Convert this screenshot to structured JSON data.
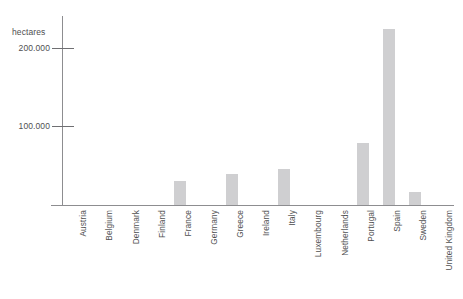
{
  "chart_data": {
    "type": "bar",
    "title": "",
    "subtitle": "",
    "xlabel": "",
    "ylabel": "hectares",
    "ylim": [
      0,
      240000
    ],
    "yticks": [
      100000,
      200000
    ],
    "ytick_labels": [
      "100.000",
      "200.000"
    ],
    "grid": false,
    "legend": null,
    "categories": [
      "Austria",
      "Belgium",
      "Denmark",
      "Finland",
      "France",
      "Germany",
      "Greece",
      "Ireland",
      "Italy",
      "Luxembourg",
      "Netherlands",
      "Portugal",
      "Spain",
      "Sweden",
      "United Kingdom"
    ],
    "values": [
      0,
      0,
      0,
      0,
      30000,
      0,
      39000,
      0,
      46000,
      0,
      0,
      79000,
      224000,
      17000,
      0
    ],
    "bar_color": "#cfcfd1",
    "axis_color": "#8d8d90",
    "text_color": "#4f4f51"
  }
}
